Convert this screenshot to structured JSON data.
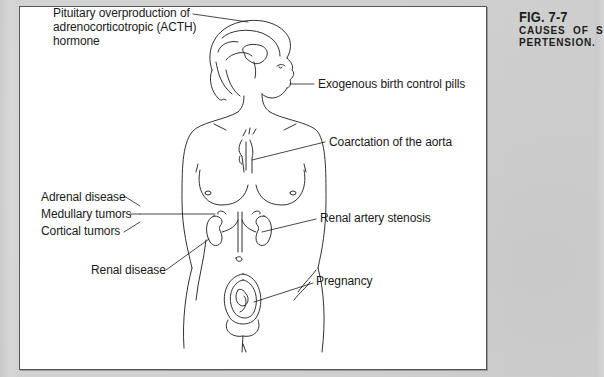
{
  "figure": {
    "number": "FIG. 7-7",
    "title_line1": "CAUSES OF S",
    "title_line2": "PERTENSION.",
    "labels": [
      {
        "id": "pituitary",
        "lines": [
          "Pituitary overproduction of",
          "adrenocorticotropic (ACTH)",
          "hormone"
        ],
        "target": "pituitary-gland"
      },
      {
        "id": "birth-control",
        "lines": [
          "Exogenous birth control pills"
        ],
        "target": "mouth"
      },
      {
        "id": "coarctation",
        "lines": [
          "Coarctation of the aorta"
        ],
        "target": "aorta"
      },
      {
        "id": "adrenal",
        "lines": [
          "Adrenal disease",
          "Medullary tumors",
          "Cortical tumors"
        ],
        "target": "adrenal-gland"
      },
      {
        "id": "renal-artery",
        "lines": [
          "Renal artery stenosis"
        ],
        "target": "right-renal-artery"
      },
      {
        "id": "renal-disease",
        "lines": [
          "Renal disease"
        ],
        "target": "left-kidney"
      },
      {
        "id": "pregnancy",
        "lines": [
          "Pregnancy"
        ],
        "target": "uterus-fetus"
      }
    ]
  },
  "colors": {
    "page_background": "#cfcfcf",
    "panel_background": "#ffffff",
    "line_art": "#1a1a1a",
    "text": "#1a1a1a"
  }
}
